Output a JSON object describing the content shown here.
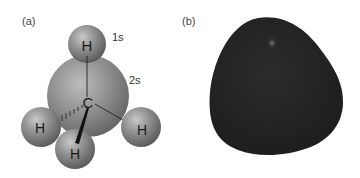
{
  "panels": [
    {
      "label": "(a)",
      "description": "Ball model of methane",
      "atoms": {
        "top_h": "H",
        "carbon": "C",
        "left_h": "H",
        "right_h": "H",
        "bottom_h": "H"
      },
      "orbital_labels": {
        "hydrogen": "1s",
        "carbon": "2s"
      }
    },
    {
      "label": "(b)",
      "description": "Electron density surface of methane"
    }
  ],
  "colors": {
    "sphere": "#8a8a8a",
    "sphere_highlight": "#c4c4c4",
    "sphere_shadow": "#555555",
    "blob": "#252525",
    "text": "#1a1a1a"
  }
}
